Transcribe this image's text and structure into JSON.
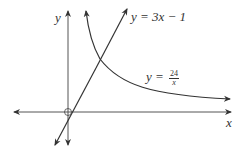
{
  "diagram": {
    "axes": {
      "x_label": "x",
      "y_label": "y",
      "origin_marker": "open-circle"
    },
    "curves": [
      {
        "id": "line",
        "label": "y = 3x − 1",
        "label_text": "y = 3x − 1"
      },
      {
        "id": "hyperbola",
        "label_prefix": "y =",
        "numerator": "24",
        "denominator": "x"
      }
    ],
    "colors": {
      "stroke": "#333333",
      "text": "#333333"
    }
  }
}
